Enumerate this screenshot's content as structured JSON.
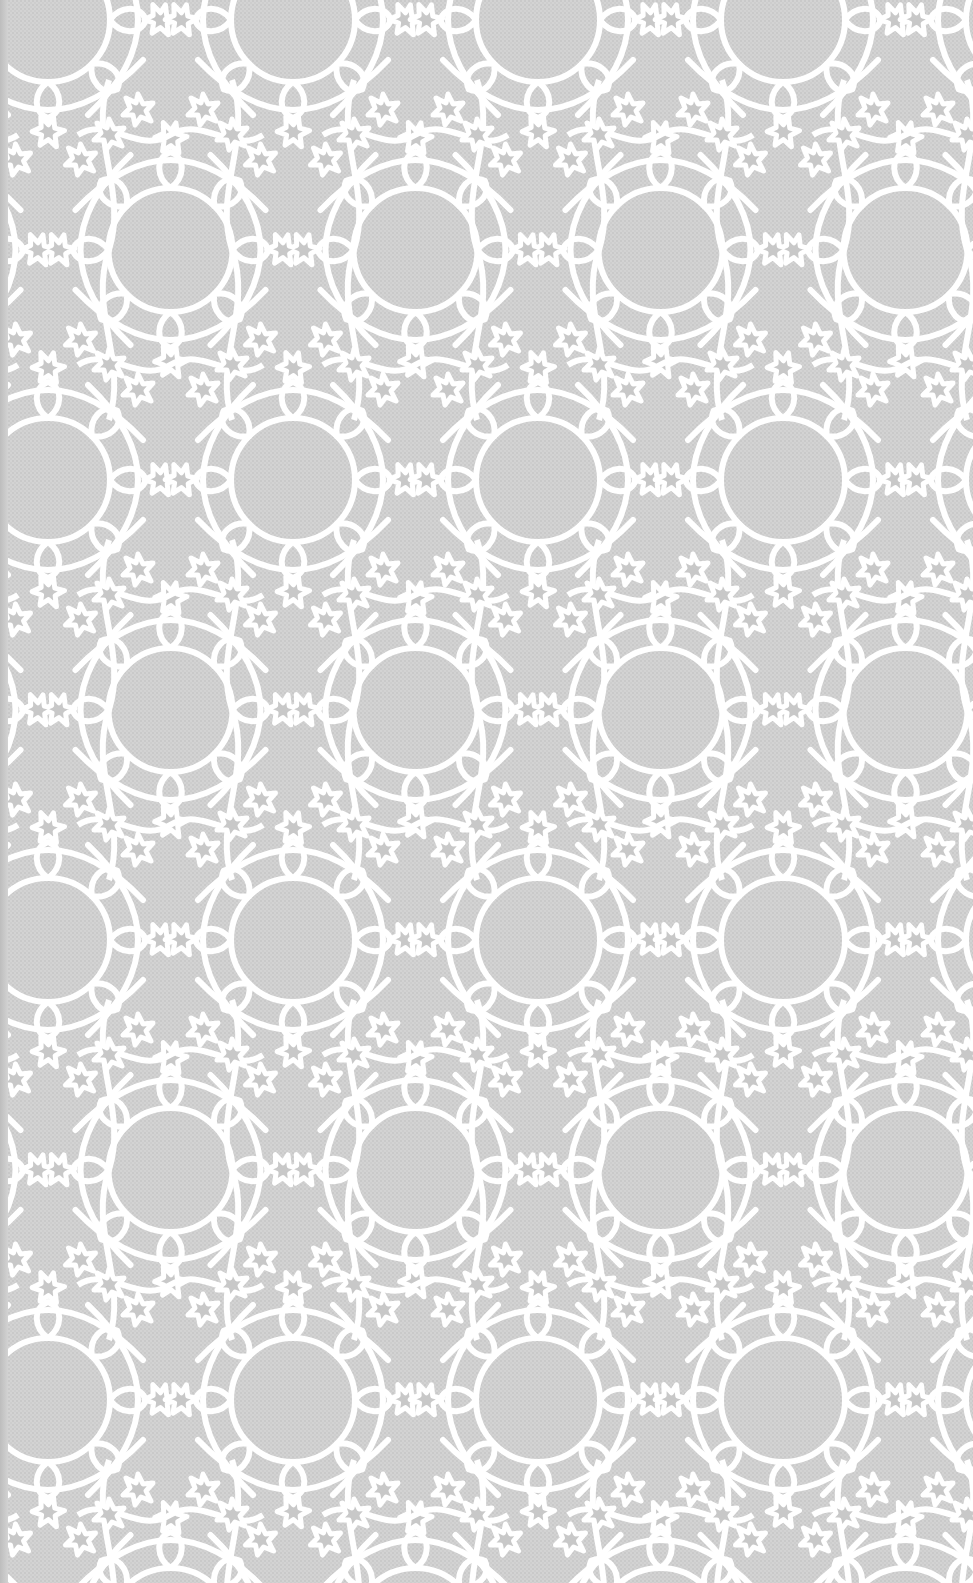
{
  "image": {
    "subject": "geometric lattice tile pattern",
    "description": "Repeating Islamic-style interlaced pattern of white lines forming teardrop loops, rosettes and six-pointed stars over a light gray woven-texture background",
    "colors": {
      "background": "#d2d2d2",
      "background_texture": "#c8c8c8",
      "line": "#ffffff",
      "star_fill": "#cbcbcb",
      "edge_shadow": "#bdbdbd"
    },
    "pattern": {
      "period_x": 245,
      "period_y": 460,
      "row_offset_x": 122.5,
      "row_offset_y": 230,
      "line_width": 6
    }
  }
}
